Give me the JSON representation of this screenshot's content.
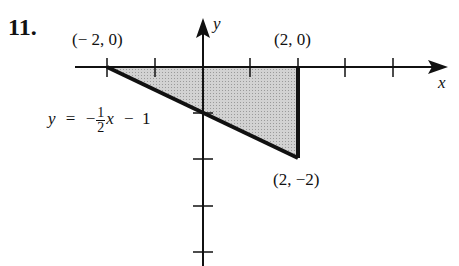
{
  "problem_number": "11.",
  "axes": {
    "x_label": "x",
    "y_label": "y"
  },
  "points": {
    "p1": "(− 2, 0)",
    "p2": "(2, 0)",
    "p3": "(2, −2)"
  },
  "equation": {
    "lhs": "y",
    "eq": "=",
    "sign": "−",
    "num": "1",
    "den": "2",
    "var": "x",
    "rest": "−  1"
  },
  "colors": {
    "shade": "#c4c4c4",
    "line": "#111111"
  }
}
